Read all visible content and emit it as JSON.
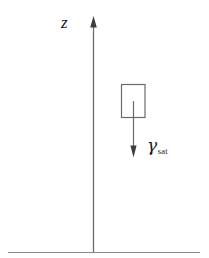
{
  "figure": {
    "background_color": "#ffffff",
    "line_color": "#4d4d4d",
    "text_color": "#1a1a1a",
    "width": 209,
    "height": 258
  },
  "axis": {
    "name": "vertical-axis",
    "label": "z",
    "direction": "up",
    "x": 93,
    "y_top": 17,
    "y_bottom": 253,
    "arrowhead": "up"
  },
  "ground_line": {
    "name": "ground-surface-line",
    "y": 252,
    "x_start": 8,
    "x_end": 200
  },
  "soil_element": {
    "name": "soil-element-rectangle",
    "x": 121,
    "y": 84,
    "width": 24,
    "height": 34
  },
  "weight_vector": {
    "name": "unit-weight-arrow",
    "symbol": "γ",
    "subscript": "sat",
    "direction": "down",
    "x": 133,
    "y_start": 101,
    "y_end": 157
  }
}
